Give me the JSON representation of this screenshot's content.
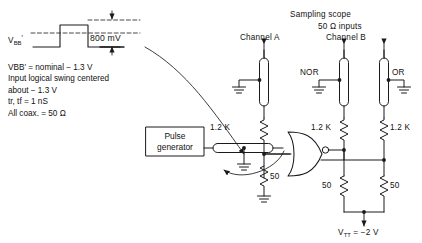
{
  "figure": {
    "stroke_color": "#1a1a1a",
    "background": "#ffffff"
  },
  "waveform": {
    "bb_label": "V",
    "bb_sub": "BB",
    "bb_prime": "′",
    "amplitude_label": "800 mV"
  },
  "notes": {
    "line1_pre": "V",
    "line1_sub": "BB",
    "line1_prime": "′",
    "line1_post": " = nominal − 1.3 V",
    "line2": "Input logical swing centered",
    "line3": "about − 1.3 V",
    "line4_pre": "t",
    "line4_sub_r": "r",
    "line4_mid": ", t",
    "line4_sub_f": "f",
    "line4_post": " = 1 nS",
    "line5": "All coax. = 50 Ω"
  },
  "scope": {
    "title": "Sampling scope",
    "inputs": "50 Ω inputs",
    "channel_a": "Channel A",
    "channel_b": "Channel B"
  },
  "gate": {
    "nor_label": "NOR",
    "or_label": "OR"
  },
  "source": {
    "line1": "Pulse",
    "line2": "generator"
  },
  "resistors": {
    "r_a": "1.2 K",
    "r_nor": "1.2 K",
    "r_or": "1.2 K",
    "r_in": "50",
    "r_term_nor": "50",
    "r_term_or": "50"
  },
  "supply": {
    "pre": "V",
    "sub": "TT",
    "post": " = −2 V"
  }
}
